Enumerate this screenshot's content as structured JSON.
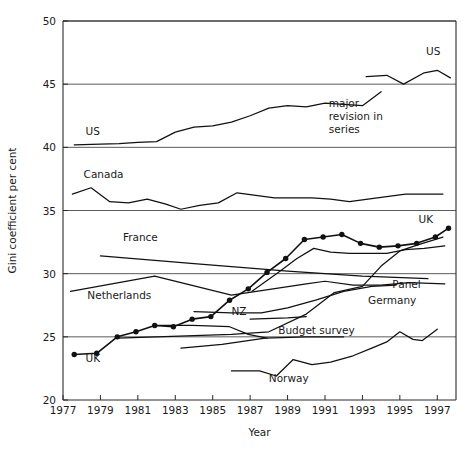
{
  "chart_data": {
    "type": "line",
    "title": "",
    "xlabel": "Year",
    "ylabel": "Gini coefficient per cent",
    "xlim": [
      1977,
      1998
    ],
    "ylim": [
      20,
      50
    ],
    "xticks": [
      1977,
      1979,
      1981,
      1983,
      1985,
      1987,
      1989,
      1991,
      1993,
      1995,
      1997
    ],
    "yticks": [
      20,
      25,
      30,
      35,
      40,
      45,
      50
    ],
    "grid": "horizontal",
    "legend": "inline-labels",
    "annotations": [
      {
        "text": "major revision in series",
        "x": 1991.2,
        "y": 43.2
      }
    ],
    "series": [
      {
        "name": "US",
        "label": "US",
        "label_x": 1978.2,
        "label_y": 41.0,
        "markers": false,
        "points": [
          [
            1977.6,
            40.2
          ],
          [
            1979.0,
            40.25
          ],
          [
            1980.0,
            40.3
          ],
          [
            1981.0,
            40.4
          ],
          [
            1982.0,
            40.45
          ],
          [
            1983.0,
            41.2
          ],
          [
            1984.0,
            41.6
          ],
          [
            1985.0,
            41.7
          ],
          [
            1986.0,
            42.0
          ],
          [
            1987.0,
            42.5
          ],
          [
            1988.0,
            43.1
          ],
          [
            1989.0,
            43.3
          ],
          [
            1990.0,
            43.2
          ],
          [
            1991.0,
            43.5
          ],
          [
            1992.0,
            43.4
          ],
          [
            1993.0,
            43.3
          ],
          [
            1994.0,
            44.4
          ]
        ]
      },
      {
        "name": "US revised",
        "label": "US",
        "label_x": 1996.4,
        "label_y": 47.3,
        "markers": false,
        "points": [
          [
            1993.2,
            45.6
          ],
          [
            1994.3,
            45.7
          ],
          [
            1995.2,
            45.0
          ],
          [
            1996.3,
            45.9
          ],
          [
            1997.0,
            46.1
          ],
          [
            1997.7,
            45.5
          ]
        ]
      },
      {
        "name": "Canada",
        "label": "Canada",
        "label_x": 1978.1,
        "label_y": 37.6,
        "markers": false,
        "points": [
          [
            1977.5,
            36.3
          ],
          [
            1978.5,
            36.8
          ],
          [
            1979.5,
            35.7
          ],
          [
            1980.5,
            35.6
          ],
          [
            1981.5,
            35.9
          ],
          [
            1982.5,
            35.5
          ],
          [
            1983.3,
            35.1
          ],
          [
            1984.3,
            35.4
          ],
          [
            1985.3,
            35.6
          ],
          [
            1986.3,
            36.4
          ],
          [
            1987.3,
            36.2
          ],
          [
            1988.3,
            36.0
          ],
          [
            1989.3,
            36.0
          ],
          [
            1990.3,
            36.0
          ],
          [
            1991.3,
            35.9
          ],
          [
            1992.3,
            35.7
          ],
          [
            1993.3,
            35.9
          ],
          [
            1994.3,
            36.1
          ],
          [
            1995.3,
            36.3
          ],
          [
            1996.3,
            36.3
          ],
          [
            1997.3,
            36.3
          ]
        ]
      },
      {
        "name": "France",
        "label": "France",
        "label_x": 1980.2,
        "label_y": 32.6,
        "markers": false,
        "points": [
          [
            1979.0,
            31.4
          ],
          [
            1984.0,
            30.8
          ],
          [
            1989.0,
            30.2
          ],
          [
            1993.0,
            29.8
          ],
          [
            1996.5,
            29.6
          ]
        ]
      },
      {
        "name": "Netherlands",
        "label": "Netherlands",
        "label_x": 1978.3,
        "label_y": 28.0,
        "markers": false,
        "points": [
          [
            1977.4,
            28.6
          ],
          [
            1981.9,
            29.8
          ],
          [
            1986.0,
            28.3
          ],
          [
            1990.0,
            29.2
          ],
          [
            1991.0,
            29.4
          ],
          [
            1992.5,
            29.1
          ],
          [
            1994.0,
            29.1
          ],
          [
            1995.5,
            29.3
          ],
          [
            1997.4,
            29.2
          ]
        ]
      },
      {
        "name": "UK",
        "label": "UK",
        "label_x": 1978.2,
        "label_y": 23.0,
        "markers": true,
        "points": [
          [
            1977.6,
            23.6
          ],
          [
            1978.8,
            23.7
          ],
          [
            1979.9,
            25.0
          ],
          [
            1980.9,
            25.4
          ],
          [
            1981.9,
            25.9
          ],
          [
            1982.9,
            25.8
          ],
          [
            1983.9,
            26.4
          ],
          [
            1984.9,
            26.6
          ],
          [
            1985.9,
            27.9
          ],
          [
            1986.9,
            28.8
          ],
          [
            1987.9,
            30.1
          ],
          [
            1988.9,
            31.2
          ],
          [
            1989.9,
            32.7
          ],
          [
            1990.9,
            32.9
          ],
          [
            1991.9,
            33.1
          ],
          [
            1992.9,
            32.4
          ],
          [
            1993.9,
            32.1
          ],
          [
            1994.9,
            32.2
          ],
          [
            1995.9,
            32.4
          ],
          [
            1996.9,
            32.9
          ],
          [
            1997.6,
            33.6
          ]
        ]
      },
      {
        "name": "UK second",
        "label": "UK",
        "label_x": 1996.0,
        "label_y": 34.0,
        "markers": false,
        "points": [
          [
            1987.1,
            28.6
          ],
          [
            1988.5,
            30.1
          ],
          [
            1989.5,
            31.2
          ],
          [
            1990.4,
            32.0
          ],
          [
            1991.3,
            31.7
          ],
          [
            1992.3,
            31.6
          ],
          [
            1993.3,
            31.6
          ],
          [
            1994.3,
            31.6
          ],
          [
            1995.3,
            31.9
          ],
          [
            1996.3,
            32.0
          ],
          [
            1997.4,
            32.2
          ]
        ]
      },
      {
        "name": "NZ",
        "label": "NZ",
        "label_x": 1986.0,
        "label_y": 26.7,
        "markers": false,
        "points": [
          [
            1979.9,
            24.9
          ],
          [
            1982.0,
            25.0
          ],
          [
            1984.0,
            25.1
          ],
          [
            1986.0,
            25.2
          ],
          [
            1988.0,
            25.4
          ],
          [
            1990.0,
            26.8
          ],
          [
            1991.5,
            28.5
          ],
          [
            1993.0,
            29.0
          ],
          [
            1994.0,
            30.6
          ],
          [
            1995.0,
            31.8
          ],
          [
            1996.0,
            32.3
          ],
          [
            1997.3,
            32.9
          ]
        ]
      },
      {
        "name": "NZ branch",
        "label": "",
        "label_x": 0,
        "label_y": 0,
        "markers": false,
        "points": [
          [
            1981.9,
            25.9
          ],
          [
            1983.9,
            25.9
          ],
          [
            1985.9,
            25.8
          ],
          [
            1986.9,
            25.2
          ],
          [
            1987.9,
            24.9
          ]
        ]
      },
      {
        "name": "Germany",
        "label": "Germany",
        "label_x": 1993.3,
        "label_y": 27.6,
        "markers": false,
        "points": [
          [
            1984.0,
            27.0
          ],
          [
            1986.0,
            26.9
          ],
          [
            1987.6,
            26.9
          ],
          [
            1989.0,
            27.3
          ],
          [
            1990.5,
            27.9
          ],
          [
            1992.0,
            28.6
          ],
          [
            1993.5,
            29.0
          ],
          [
            1994.8,
            29.1
          ]
        ]
      },
      {
        "name": "Panel",
        "label": "Panel",
        "label_x": 1994.6,
        "label_y": 28.9,
        "markers": false,
        "points": [
          [
            1987.0,
            26.4
          ],
          [
            1989.0,
            26.5
          ],
          [
            1990.0,
            26.6
          ]
        ]
      },
      {
        "name": "Budget survey",
        "label": "Budget survey",
        "label_x": 1988.5,
        "label_y": 25.2,
        "markers": false,
        "points": [
          [
            1983.3,
            24.1
          ],
          [
            1985.5,
            24.4
          ],
          [
            1987.8,
            24.9
          ],
          [
            1990.0,
            25.0
          ],
          [
            1992.0,
            25.0
          ]
        ]
      },
      {
        "name": "Norway",
        "label": "Norway",
        "label_x": 1988.0,
        "label_y": 21.4,
        "markers": false,
        "points": [
          [
            1986.0,
            22.3
          ],
          [
            1987.5,
            22.3
          ],
          [
            1988.4,
            21.9
          ],
          [
            1989.3,
            23.2
          ],
          [
            1990.3,
            22.8
          ],
          [
            1991.3,
            23.0
          ],
          [
            1992.5,
            23.5
          ],
          [
            1993.5,
            24.1
          ],
          [
            1994.3,
            24.6
          ],
          [
            1995.0,
            25.4
          ],
          [
            1995.7,
            24.8
          ],
          [
            1996.2,
            24.7
          ],
          [
            1997.0,
            25.6
          ]
        ]
      }
    ]
  },
  "geometry": {
    "plot_left": 63,
    "plot_right": 456,
    "plot_top": 21,
    "plot_bottom": 400
  },
  "axis": {
    "y_title": "Gini coefficient per cent",
    "x_title": "Year"
  }
}
